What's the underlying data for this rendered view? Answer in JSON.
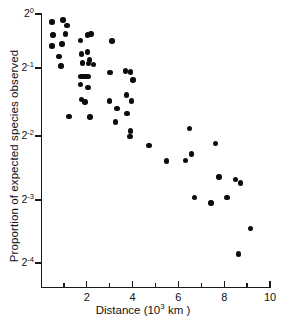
{
  "figure": {
    "background_color": "#ffffff",
    "marker_color": "#0d0d0d",
    "axis_color": "#1a1a1a"
  },
  "chart_data": {
    "type": "scatter",
    "title": "",
    "subtitle": "",
    "xlabel": "Distance (10",
    "xlabel_exponent": "3",
    "xlabel_suffix": " km )",
    "xlabel_full": "Distance (10³ km )",
    "ylabel": "Proportion of expected species observed",
    "xscale": "linear",
    "yscale": "log2",
    "xlim": [
      0,
      10
    ],
    "ylim": [
      0.0625,
      1.0
    ],
    "grid": false,
    "legend": null,
    "annotations": [],
    "x_major_ticks": [
      2,
      4,
      6,
      8,
      10
    ],
    "x_major_tick_labels": [
      "2",
      "4",
      "6",
      "8",
      "10"
    ],
    "x_minor_ticks": [
      1,
      3,
      5,
      7,
      9
    ],
    "y_major_ticks": [
      1.0,
      0.5,
      0.25,
      0.125,
      0.0625
    ],
    "y_major_tick_labels": [
      "2",
      "2",
      "2",
      "2",
      "2"
    ],
    "y_major_tick_exponents": [
      "0",
      "-1",
      "-2",
      "-3",
      "-4"
    ],
    "y_tick_pixel_positions": [
      14,
      68,
      136,
      200,
      263
    ],
    "x_axis_origin_px": 41,
    "x_px_per_unit": 22.9,
    "n_points": 63,
    "points": [
      {
        "x": 0.48,
        "y": 0.915
      },
      {
        "x": 0.96,
        "y": 0.935
      },
      {
        "x": 1.14,
        "y": 0.88
      },
      {
        "x": 0.52,
        "y": 0.79
      },
      {
        "x": 1.08,
        "y": 0.8
      },
      {
        "x": 0.48,
        "y": 0.7
      },
      {
        "x": 0.92,
        "y": 0.715
      },
      {
        "x": 0.78,
        "y": 0.625
      },
      {
        "x": 0.88,
        "y": 0.56
      },
      {
        "x": 1.72,
        "y": 0.745
      },
      {
        "x": 2.02,
        "y": 0.79
      },
      {
        "x": 2.18,
        "y": 0.8
      },
      {
        "x": 1.78,
        "y": 0.64
      },
      {
        "x": 2.02,
        "y": 0.655
      },
      {
        "x": 2.12,
        "y": 0.6
      },
      {
        "x": 1.82,
        "y": 0.58
      },
      {
        "x": 2.08,
        "y": 0.575
      },
      {
        "x": 2.28,
        "y": 0.57
      },
      {
        "x": 1.74,
        "y": 0.5
      },
      {
        "x": 1.84,
        "y": 0.5
      },
      {
        "x": 1.96,
        "y": 0.5
      },
      {
        "x": 2.06,
        "y": 0.5
      },
      {
        "x": 1.72,
        "y": 0.455
      },
      {
        "x": 2.06,
        "y": 0.44
      },
      {
        "x": 1.78,
        "y": 0.385
      },
      {
        "x": 1.92,
        "y": 0.375
      },
      {
        "x": 1.22,
        "y": 0.32
      },
      {
        "x": 2.14,
        "y": 0.318
      },
      {
        "x": 3.1,
        "y": 0.74
      },
      {
        "x": 3.02,
        "y": 0.52
      },
      {
        "x": 2.98,
        "y": 0.38
      },
      {
        "x": 3.32,
        "y": 0.35
      },
      {
        "x": 3.26,
        "y": 0.3
      },
      {
        "x": 3.7,
        "y": 0.53
      },
      {
        "x": 3.92,
        "y": 0.525
      },
      {
        "x": 4.02,
        "y": 0.48
      },
      {
        "x": 3.74,
        "y": 0.405
      },
      {
        "x": 3.94,
        "y": 0.38
      },
      {
        "x": 3.76,
        "y": 0.33
      },
      {
        "x": 3.92,
        "y": 0.272
      },
      {
        "x": 3.88,
        "y": 0.255
      },
      {
        "x": 4.72,
        "y": 0.232
      },
      {
        "x": 5.48,
        "y": 0.195
      },
      {
        "x": 6.3,
        "y": 0.196
      },
      {
        "x": 6.48,
        "y": 0.28
      },
      {
        "x": 6.58,
        "y": 0.21
      },
      {
        "x": 6.7,
        "y": 0.13
      },
      {
        "x": 7.42,
        "y": 0.122
      },
      {
        "x": 7.62,
        "y": 0.236
      },
      {
        "x": 7.78,
        "y": 0.163
      },
      {
        "x": 8.12,
        "y": 0.13
      },
      {
        "x": 8.48,
        "y": 0.158
      },
      {
        "x": 8.72,
        "y": 0.152
      },
      {
        "x": 8.62,
        "y": 0.069
      },
      {
        "x": 9.14,
        "y": 0.092
      }
    ]
  }
}
